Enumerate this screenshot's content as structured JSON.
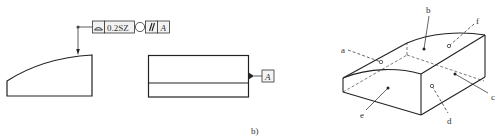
{
  "figure": {
    "sublabel": "b)",
    "feature_control_frame": {
      "symbol": "profile-of-surface",
      "tolerance": "0.2SZ",
      "modifier": "circle",
      "orientation_symbol": "//",
      "datum": "A"
    },
    "datum_feature": {
      "label": "A"
    },
    "iso_labels": {
      "a": "a",
      "b": "b",
      "c_right": "c",
      "d": "d",
      "e": "e",
      "f": "f"
    }
  },
  "colors": {
    "line": "#222222",
    "frame_fill": "#f2f2f2",
    "background": "#ffffff"
  }
}
